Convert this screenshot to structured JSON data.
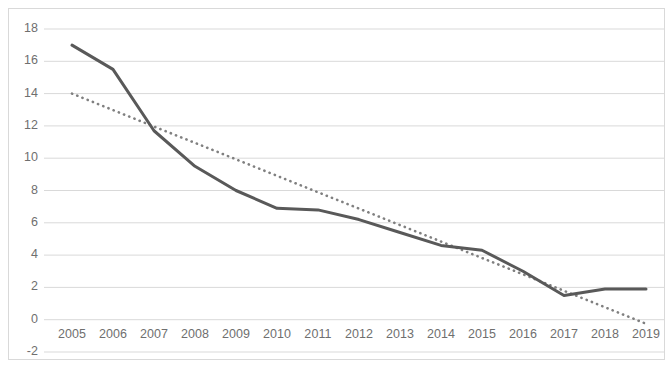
{
  "chart_data": {
    "type": "line",
    "title": "",
    "subtitle": "",
    "xlabel": "",
    "ylabel": "",
    "categories": [
      "2005",
      "2006",
      "2007",
      "2008",
      "2009",
      "2010",
      "2011",
      "2012",
      "2013",
      "2014",
      "2015",
      "2016",
      "2017",
      "2018",
      "2019"
    ],
    "x_tick_labels": [
      "2005",
      "2006",
      "2007",
      "2008",
      "2009",
      "2010",
      "2011",
      "2012",
      "2013",
      "2014",
      "2015",
      "2016",
      "2017",
      "2018",
      "2019"
    ],
    "y_tick_labels": [
      "18",
      "16",
      "14",
      "12",
      "10",
      "8",
      "6",
      "4",
      "2",
      "0",
      "-2"
    ],
    "y_ticks": [
      18,
      16,
      14,
      12,
      10,
      8,
      6,
      4,
      2,
      0,
      -2
    ],
    "ylim": [
      -2,
      18
    ],
    "grid": "horizontal",
    "legend": "none",
    "series": [
      {
        "name": "data",
        "style": "solid",
        "color": "#595959",
        "values": [
          17.0,
          15.5,
          11.7,
          9.5,
          8.0,
          6.9,
          6.8,
          6.2,
          5.4,
          4.6,
          4.3,
          3.0,
          1.5,
          1.9,
          1.9
        ]
      },
      {
        "name": "trendline",
        "style": "dotted",
        "color": "#808080",
        "values": [
          14.0,
          12.98,
          11.96,
          10.95,
          9.93,
          8.91,
          7.89,
          6.88,
          5.86,
          4.84,
          3.82,
          2.81,
          1.79,
          0.77,
          -0.25
        ]
      }
    ],
    "colors": {
      "series_line": "#595959",
      "trendline": "#808080",
      "gridline": "#d9d9d9",
      "frame": "#d9d9d9",
      "tick_text": "#6f6f6f",
      "background": "#ffffff"
    }
  }
}
